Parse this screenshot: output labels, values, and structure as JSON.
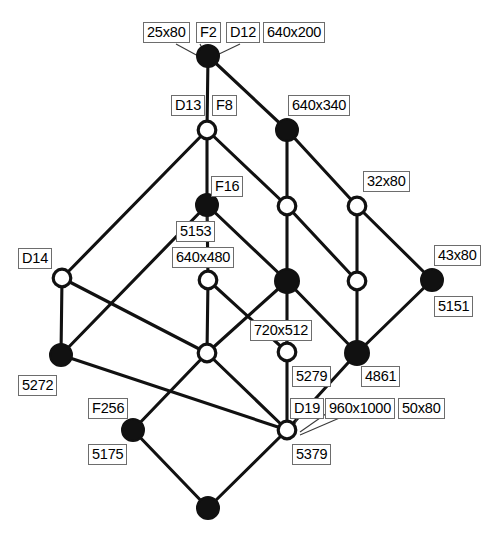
{
  "figure": {
    "type": "node-link-diagram",
    "canvas": {
      "width": 498,
      "height": 537
    },
    "node_styles": {
      "filled": "solid black disc",
      "open": "white disc with black outline"
    }
  },
  "nodes": [
    {
      "id": "n_d12",
      "x": 208,
      "y": 56,
      "fill": "filled",
      "r": 11
    },
    {
      "id": "n_d13",
      "x": 207,
      "y": 130,
      "fill": "open",
      "r": 10
    },
    {
      "id": "n_640x340",
      "x": 287,
      "y": 130,
      "fill": "filled",
      "r": 11
    },
    {
      "id": "n_f16",
      "x": 207,
      "y": 205,
      "fill": "filled",
      "r": 11
    },
    {
      "id": "n_mid1",
      "x": 287,
      "y": 206,
      "fill": "open",
      "r": 10
    },
    {
      "id": "n_32x80",
      "x": 357,
      "y": 206,
      "fill": "open",
      "r": 10
    },
    {
      "id": "n_d14",
      "x": 62,
      "y": 278,
      "fill": "open",
      "r": 10
    },
    {
      "id": "n_640x480",
      "x": 208,
      "y": 280,
      "fill": "open",
      "r": 10
    },
    {
      "id": "n_mid2",
      "x": 287,
      "y": 281,
      "fill": "filled",
      "r": 12
    },
    {
      "id": "n_mid3",
      "x": 357,
      "y": 281,
      "fill": "open",
      "r": 10
    },
    {
      "id": "n_43x80",
      "x": 432,
      "y": 280,
      "fill": "filled",
      "r": 11
    },
    {
      "id": "n_5272",
      "x": 61,
      "y": 355,
      "fill": "filled",
      "r": 11
    },
    {
      "id": "n_low1",
      "x": 207,
      "y": 353,
      "fill": "open",
      "r": 10
    },
    {
      "id": "n_5279",
      "x": 287,
      "y": 352,
      "fill": "open",
      "r": 10
    },
    {
      "id": "n_4861",
      "x": 357,
      "y": 353,
      "fill": "filled",
      "r": 12
    },
    {
      "id": "n_5175",
      "x": 133,
      "y": 430,
      "fill": "filled",
      "r": 11
    },
    {
      "id": "n_5379",
      "x": 287,
      "y": 430,
      "fill": "open",
      "r": 10
    },
    {
      "id": "n_bottom",
      "x": 208,
      "y": 508,
      "fill": "filled",
      "r": 11
    }
  ],
  "edges": [
    [
      "n_d12",
      "n_d13"
    ],
    [
      "n_d12",
      "n_640x340"
    ],
    [
      "n_d13",
      "n_f16"
    ],
    [
      "n_d13",
      "n_mid1"
    ],
    [
      "n_d13",
      "n_d14"
    ],
    [
      "n_640x340",
      "n_mid1"
    ],
    [
      "n_640x340",
      "n_32x80"
    ],
    [
      "n_f16",
      "n_640x480"
    ],
    [
      "n_f16",
      "n_mid2"
    ],
    [
      "n_f16",
      "n_5272"
    ],
    [
      "n_mid1",
      "n_mid2"
    ],
    [
      "n_mid1",
      "n_mid3"
    ],
    [
      "n_32x80",
      "n_mid3"
    ],
    [
      "n_32x80",
      "n_43x80"
    ],
    [
      "n_d14",
      "n_5272"
    ],
    [
      "n_d14",
      "n_low1"
    ],
    [
      "n_640x480",
      "n_low1"
    ],
    [
      "n_640x480",
      "n_5279"
    ],
    [
      "n_mid2",
      "n_low1"
    ],
    [
      "n_mid2",
      "n_5279"
    ],
    [
      "n_mid2",
      "n_4861"
    ],
    [
      "n_mid3",
      "n_4861"
    ],
    [
      "n_43x80",
      "n_4861"
    ],
    [
      "n_5272",
      "n_5379"
    ],
    [
      "n_low1",
      "n_5175"
    ],
    [
      "n_low1",
      "n_5379"
    ],
    [
      "n_5279",
      "n_5379"
    ],
    [
      "n_4861",
      "n_5379"
    ],
    [
      "n_5175",
      "n_bottom"
    ],
    [
      "n_5379",
      "n_bottom"
    ]
  ],
  "leaders": [
    {
      "from": [
        176,
        44
      ],
      "to": [
        200,
        57
      ]
    },
    {
      "from": [
        200,
        44
      ],
      "to": [
        203,
        50
      ]
    },
    {
      "from": [
        240,
        44
      ],
      "to": [
        217,
        55
      ]
    },
    {
      "from": [
        207,
        222
      ],
      "to": [
        207,
        216
      ]
    },
    {
      "from": [
        285,
        340
      ],
      "to": [
        289,
        344
      ]
    },
    {
      "from": [
        302,
        404
      ],
      "to": [
        295,
        424
      ]
    },
    {
      "from": [
        340,
        404
      ],
      "to": [
        300,
        432
      ]
    },
    {
      "from": [
        372,
        404
      ],
      "to": [
        300,
        435
      ]
    }
  ],
  "labels": [
    {
      "id": "lbl_25x80",
      "text": "25x80",
      "x": 143,
      "y": 22
    },
    {
      "id": "lbl_f2",
      "text": "F2",
      "x": 196,
      "y": 22
    },
    {
      "id": "lbl_d12",
      "text": "D12",
      "x": 226,
      "y": 22
    },
    {
      "id": "lbl_640x200",
      "text": "640x200",
      "x": 263,
      "y": 22
    },
    {
      "id": "lbl_d13",
      "text": "D13",
      "x": 171,
      "y": 95
    },
    {
      "id": "lbl_f8",
      "text": "F8",
      "x": 212,
      "y": 95
    },
    {
      "id": "lbl_640x340",
      "text": "640x340",
      "x": 288,
      "y": 95
    },
    {
      "id": "lbl_f16",
      "text": "F16",
      "x": 211,
      "y": 176
    },
    {
      "id": "lbl_32x80",
      "text": "32x80",
      "x": 363,
      "y": 171
    },
    {
      "id": "lbl_5153",
      "text": "5153",
      "x": 176,
      "y": 221
    },
    {
      "id": "lbl_640x480",
      "text": "640x480",
      "x": 172,
      "y": 247
    },
    {
      "id": "lbl_d14",
      "text": "D14",
      "x": 18,
      "y": 248
    },
    {
      "id": "lbl_43x80",
      "text": "43x80",
      "x": 434,
      "y": 245
    },
    {
      "id": "lbl_5151",
      "text": "5151",
      "x": 434,
      "y": 296
    },
    {
      "id": "lbl_720x512",
      "text": "720x512",
      "x": 250,
      "y": 320
    },
    {
      "id": "lbl_5272",
      "text": "5272",
      "x": 18,
      "y": 375
    },
    {
      "id": "lbl_5279",
      "text": "5279",
      "x": 292,
      "y": 366
    },
    {
      "id": "lbl_4861",
      "text": "4861",
      "x": 361,
      "y": 366
    },
    {
      "id": "lbl_f256",
      "text": "F256",
      "x": 88,
      "y": 398
    },
    {
      "id": "lbl_d19",
      "text": "D19",
      "x": 290,
      "y": 398
    },
    {
      "id": "lbl_960x1000",
      "text": "960x1000",
      "x": 325,
      "y": 398
    },
    {
      "id": "lbl_50x80",
      "text": "50x80",
      "x": 398,
      "y": 398
    },
    {
      "id": "lbl_5175",
      "text": "5175",
      "x": 88,
      "y": 444
    },
    {
      "id": "lbl_5379",
      "text": "5379",
      "x": 292,
      "y": 444
    }
  ]
}
